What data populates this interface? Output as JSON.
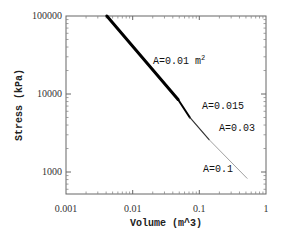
{
  "chart_data": {
    "type": "line",
    "title": "",
    "xlabel": "Volume (m^3)",
    "ylabel": "Stress (kPa)",
    "xscale": "log",
    "yscale": "log",
    "xlim": [
      0.001,
      1
    ],
    "ylim": [
      525,
      100000
    ],
    "x_ticks": [
      "0.001",
      "0.01",
      "0.1",
      "1"
    ],
    "y_ticks": [
      "1000",
      "10000",
      "100000"
    ],
    "grid": false,
    "legend": null,
    "series": [
      {
        "name": "A=0.01 m2",
        "x": [
          0.0041,
          0.048
        ],
        "y": [
          100000,
          8500
        ],
        "stroke_width": 3
      },
      {
        "name": "A=0.015",
        "x": [
          0.048,
          0.072
        ],
        "y": [
          8500,
          5000
        ],
        "stroke_width": 2
      },
      {
        "name": "A=0.03",
        "x": [
          0.072,
          0.14
        ],
        "y": [
          5000,
          2600
        ],
        "stroke_width": 1.2
      },
      {
        "name": "A=0.1",
        "x": [
          0.14,
          0.52
        ],
        "y": [
          2600,
          830
        ],
        "stroke_width": 0.7
      }
    ],
    "annotations": [
      {
        "text": "A=0.01 m",
        "sup": "2",
        "x": 0.022,
        "y": 25000
      },
      {
        "text": "A=0.015",
        "x": 0.1,
        "y": 6400
      },
      {
        "text": "A=0.03",
        "x": 0.17,
        "y": 3400
      },
      {
        "text": "A=0.1",
        "x": 0.13,
        "y": 1100
      }
    ]
  },
  "labels": {
    "xlabel": "Volume (m^3)",
    "ylabel": "Stress (kPa)",
    "xt0": "0.001",
    "xt1": "0.01",
    "xt2": "0.1",
    "xt3": "1",
    "yt0": "1000",
    "yt1": "10000",
    "yt2": "100000",
    "a1": "A=0.01 m",
    "a1sup": "2",
    "a2": "A=0.015",
    "a3": "A=0.03",
    "a4": "A=0.1"
  }
}
